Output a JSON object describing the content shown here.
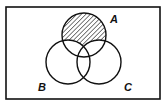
{
  "diagram": {
    "type": "venn",
    "universe": {
      "x": 6,
      "y": 7,
      "width": 154,
      "height": 92
    },
    "sets": [
      {
        "name": "A",
        "cx": 84,
        "cy": 35,
        "r": 22,
        "label_x": 110,
        "label_y": 23
      },
      {
        "name": "B",
        "cx": 68,
        "cy": 62,
        "r": 22,
        "label_x": 38,
        "label_y": 91
      },
      {
        "name": "C",
        "cx": 99,
        "cy": 62,
        "r": 22,
        "label_x": 124,
        "label_y": 91
      }
    ],
    "shaded_region": "A only (A − (B ∪ C))",
    "colors": {
      "stroke": "#111111",
      "background": "#ffffff",
      "hatch": "#111111"
    }
  }
}
